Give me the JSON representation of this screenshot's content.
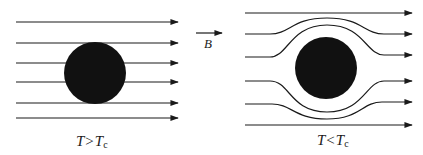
{
  "field": {
    "arrow_label": "B",
    "direction": "left-to-right"
  },
  "panels": [
    {
      "id": "normal",
      "caption_main": "T",
      "caption_op": ">",
      "caption_var": "T",
      "caption_sub": "c",
      "description": "Field lines pass straight through the sample",
      "line_count": 6
    },
    {
      "id": "superconducting",
      "caption_main": "T",
      "caption_op": "<",
      "caption_var": "T",
      "caption_sub": "c",
      "description": "Field lines are expelled and bend around the sample",
      "line_count": 6
    }
  ],
  "colors": {
    "ink": "#1a1a1a",
    "background": "#ffffff"
  }
}
